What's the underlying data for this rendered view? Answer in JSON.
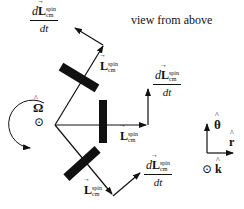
{
  "diagram": {
    "title": "view from above",
    "rotation_label": "Ω",
    "rotation_dir_symbol": "⊙",
    "vector_symbol": "L",
    "superscript": "spin",
    "subscript": "cm",
    "derivative_numerator_d": "d",
    "derivative_denominator": "dt",
    "arms": [
      {
        "name": "upper",
        "L_label": "L",
        "dLdt_label": "dL/dt"
      },
      {
        "name": "middle",
        "L_label": "L",
        "dLdt_label": "dL/dt"
      },
      {
        "name": "lower",
        "L_label": "L",
        "dLdt_label": "dL/dt"
      }
    ],
    "axes": {
      "theta": "θ",
      "r": "r",
      "k": "k",
      "k_symbol": "⊙"
    },
    "colors": {
      "ink": "#111111",
      "background": "#ffffff"
    }
  }
}
